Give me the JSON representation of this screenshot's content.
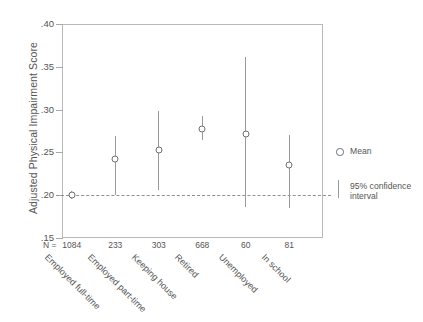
{
  "chart_data": {
    "type": "scatter",
    "title": "",
    "xlabel": "",
    "ylabel": "Adjusted Physical Impairment Score",
    "ylim": [
      0.15,
      0.4
    ],
    "yticks": [
      0.4,
      0.35,
      0.3,
      0.25,
      0.2,
      0.15
    ],
    "ytick_labels": [
      ".40",
      ".35",
      ".30",
      ".25",
      ".20",
      ".15"
    ],
    "grid": false,
    "reference_line": {
      "value": 0.2,
      "style": "dashed",
      "label": ""
    },
    "categories": [
      "Employed full-time",
      "Employed part-time",
      "Keeping house",
      "Retired",
      "Unemployed",
      "In school"
    ],
    "n_label": "N =",
    "n_values": [
      "1084",
      "233",
      "303",
      "668",
      "60",
      "81"
    ],
    "values": [
      0.2,
      0.242,
      0.253,
      0.277,
      0.271,
      0.235
    ],
    "ci_lower": [
      0.196,
      0.2,
      0.206,
      0.265,
      0.186,
      0.185
    ],
    "ci_upper": [
      0.205,
      0.269,
      0.298,
      0.293,
      0.361,
      0.27
    ],
    "series": [
      {
        "name": "Mean",
        "values": [
          0.2,
          0.242,
          0.253,
          0.277,
          0.271,
          0.235
        ]
      }
    ],
    "legend": {
      "position": "right",
      "entries": [
        {
          "label": "Mean",
          "marker": "diamond-open"
        },
        {
          "label": "95% confidence\ninterval",
          "marker": "vertical-bar"
        }
      ]
    }
  },
  "legend": {
    "mean_label": "Mean",
    "ci_label_line1": "95% confidence",
    "ci_label_line2": "interval"
  },
  "axis": {
    "y_title": "Adjusted Physical Impairment Score",
    "n_prefix": "N ="
  },
  "colors": {
    "marker_stroke": "#6e6e6e",
    "ci_bar": "#9a9a9a",
    "frame": "#b9b9b9",
    "text": "#555555",
    "reference_line": "#8f8f8f",
    "background": "#ffffff"
  }
}
